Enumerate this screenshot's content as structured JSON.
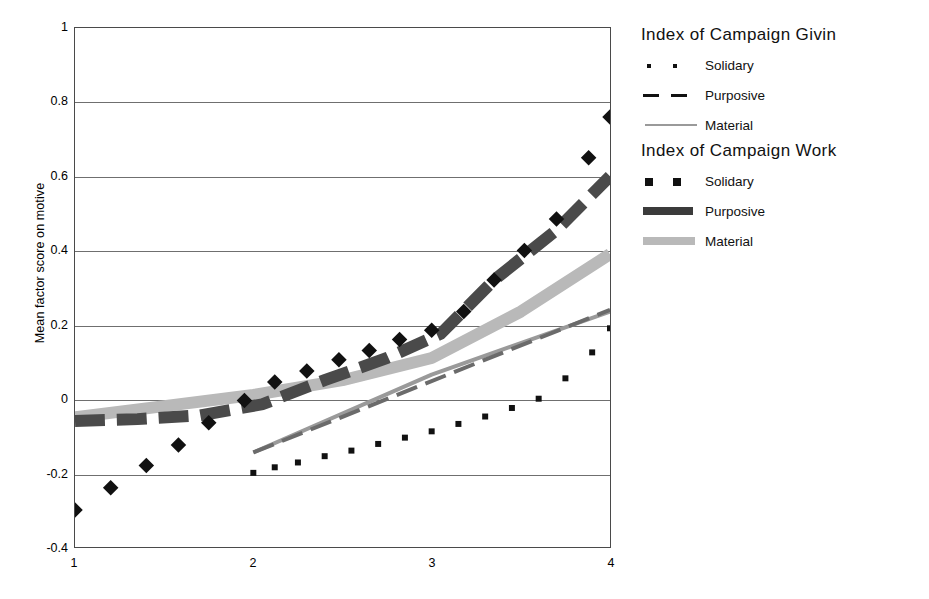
{
  "chart_data": {
    "type": "scatter",
    "title": "",
    "xlabel": "",
    "ylabel": "Mean factor score on motive",
    "xlim": [
      1,
      4
    ],
    "ylim": [
      -0.4,
      1.0
    ],
    "xticks": [
      "1",
      "2",
      "3",
      "4"
    ],
    "yticks": [
      "1",
      "0.8",
      "0.6",
      "0.4",
      "0.2",
      "0",
      "-0.2",
      "-0.4"
    ],
    "ytick_values": [
      1,
      0.8,
      0.6,
      0.4,
      0.2,
      0,
      -0.2,
      -0.4
    ],
    "xtick_values": [
      1,
      2,
      3,
      4
    ],
    "grid": true,
    "legend_position": "right",
    "series": [
      {
        "name": "Index of Campaign Giving — Solidary",
        "group": "Index of Campaign Giving",
        "label": "Solidary",
        "style": "dotted-thin",
        "color": "#111111",
        "x": [
          2.0,
          2.12,
          2.25,
          2.4,
          2.55,
          2.7,
          2.85,
          3.0,
          3.15,
          3.3,
          3.45,
          3.6,
          3.75,
          3.9,
          4.0
        ],
        "y": [
          -0.2,
          -0.185,
          -0.172,
          -0.155,
          -0.14,
          -0.122,
          -0.105,
          -0.088,
          -0.068,
          -0.048,
          -0.025,
          0.0,
          0.055,
          0.125,
          0.19
        ]
      },
      {
        "name": "Index of Campaign Giving — Purposive",
        "group": "Index of Campaign Giving",
        "label": "Purposive",
        "style": "dashed-thin",
        "color": "#6b6b6b",
        "x": [
          2.0,
          4.0
        ],
        "y": [
          -0.145,
          0.24
        ]
      },
      {
        "name": "Index of Campaign Giving — Material",
        "group": "Index of Campaign Giving",
        "label": "Material",
        "style": "solid-thin",
        "color": "#9a9a9a",
        "x": [
          2.0,
          3.0,
          4.0
        ],
        "y": [
          -0.145,
          0.065,
          0.235
        ]
      },
      {
        "name": "Index of Campaign Work — Solidary",
        "group": "Index of Campaign Work",
        "label": "Solidary",
        "style": "square-markers",
        "color": "#111111",
        "x": [
          1.0,
          1.2,
          1.4,
          1.58,
          1.75,
          1.95,
          2.12,
          2.3,
          2.48,
          2.65,
          2.82,
          3.0,
          3.18,
          3.35,
          3.52,
          3.7,
          3.88,
          4.0
        ],
        "y": [
          -0.3,
          -0.24,
          -0.18,
          -0.125,
          -0.065,
          -0.005,
          0.045,
          0.075,
          0.105,
          0.13,
          0.16,
          0.185,
          0.235,
          0.32,
          0.4,
          0.485,
          0.65,
          0.76
        ]
      },
      {
        "name": "Index of Campaign Work — Purposive",
        "group": "Index of Campaign Work",
        "label": "Purposive",
        "style": "dashed-thick",
        "color": "#4a4a4a",
        "x": [
          1.0,
          1.35,
          1.7,
          2.05,
          2.4,
          2.75,
          3.05,
          3.35,
          3.7,
          4.0
        ],
        "y": [
          -0.06,
          -0.055,
          -0.045,
          -0.015,
          0.05,
          0.11,
          0.175,
          0.32,
          0.455,
          0.6
        ]
      },
      {
        "name": "Index of Campaign Work — Material",
        "group": "Index of Campaign Work",
        "label": "Material",
        "style": "solid-thick",
        "color": "#b9b9b9",
        "x": [
          1.0,
          1.5,
          2.0,
          2.5,
          3.0,
          3.5,
          4.0
        ],
        "y": [
          -0.05,
          -0.02,
          0.01,
          0.05,
          0.11,
          0.235,
          0.39
        ]
      }
    ]
  },
  "axes": {
    "ylabel": "Mean factor score on motive",
    "yticks": [
      "1",
      "0.8",
      "0.6",
      "0.4",
      "0.2",
      "0",
      "-0.2",
      "-0.4"
    ],
    "xticks": [
      "1",
      "2",
      "3",
      "4"
    ]
  },
  "legend": {
    "groups": [
      {
        "title": "Index of Campaign Givin",
        "items": [
          {
            "label": "Solidary",
            "swatch": "dotted-thin-swatch"
          },
          {
            "label": "Purposive",
            "swatch": "dashed-thin-swatch"
          },
          {
            "label": "Material",
            "swatch": "solid-thin-swatch"
          }
        ]
      },
      {
        "title": "Index of Campaign Work",
        "items": [
          {
            "label": "Solidary",
            "swatch": "square-marker-swatch"
          },
          {
            "label": "Purposive",
            "swatch": "dashed-thick-swatch"
          },
          {
            "label": "Material",
            "swatch": "solid-thick-swatch"
          }
        ]
      }
    ]
  },
  "colors": {
    "marker_black": "#111111",
    "dark_gray": "#4a4a4a",
    "mid_gray": "#6b6b6b",
    "light_gray": "#b9b9b9",
    "grid": "#6f6f6f",
    "background": "#ffffff"
  }
}
